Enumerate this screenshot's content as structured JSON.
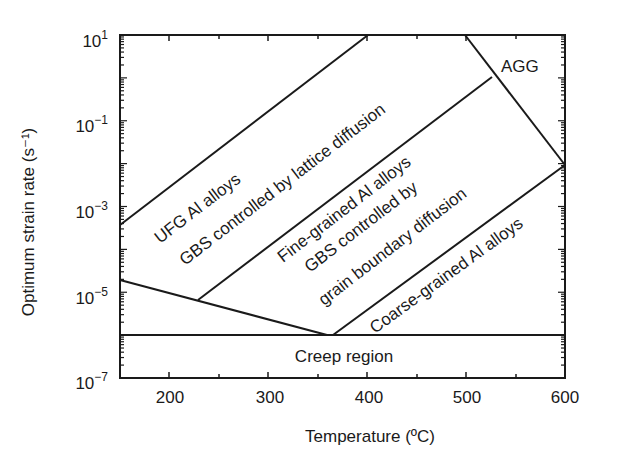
{
  "chart_data": {
    "type": "diagram",
    "title": "",
    "xlabel": "Temperature (ºC)",
    "ylabel": "Optimum strain rate (s⁻¹)",
    "xlim": [
      150,
      600
    ],
    "ylim_log10": [
      -7,
      1
    ],
    "x_ticks": [
      "200",
      "300",
      "400",
      "500",
      "600"
    ],
    "y_ticks": [
      {
        "base": "10",
        "exp": "1"
      },
      {
        "base": "10",
        "exp": "−1"
      },
      {
        "base": "10",
        "exp": "−3"
      },
      {
        "base": "10",
        "exp": "−5"
      },
      {
        "base": "10",
        "exp": "−7"
      }
    ],
    "boundaries": [
      {
        "name": "ufg-upper",
        "points": [
          [
            150,
            -3.55
          ],
          [
            400,
            1
          ]
        ]
      },
      {
        "name": "fine-grained-upper",
        "points": [
          [
            229,
            -5.3
          ],
          [
            525,
            -0.1
          ]
        ]
      },
      {
        "name": "agg-boundary",
        "points": [
          [
            497,
            1
          ],
          [
            600,
            -2
          ]
        ]
      },
      {
        "name": "coarse-grained-upper",
        "points": [
          [
            365,
            -6.0
          ],
          [
            600,
            -2
          ]
        ]
      },
      {
        "name": "lower-boundary",
        "points": [
          [
            150,
            -4.8
          ],
          [
            358,
            -6.0
          ]
        ]
      },
      {
        "name": "creep-line",
        "points": [
          [
            150,
            -6.0
          ],
          [
            600,
            -6.0
          ]
        ]
      }
    ],
    "regions": [
      {
        "label": "UFG Al alloys",
        "sublabel": "GBS controlled by lattice diffusion"
      },
      {
        "label": "Fine-grained Al alloys",
        "sublabel": "GBS controlled by grain boundary diffusion"
      },
      {
        "label": "Coarse-grained Al alloys"
      },
      {
        "label": "AGG"
      },
      {
        "label": "Creep region"
      }
    ]
  },
  "labels": {
    "ufg_line1": "UFG Al alloys",
    "ufg_line2": "GBS controlled by lattice diffusion",
    "fine_line1": "Fine-grained Al alloys",
    "fine_line2": "GBS controlled by",
    "fine_line3": "grain boundary diffusion",
    "coarse": "Coarse-grained Al alloys",
    "agg": "AGG",
    "creep": "Creep region"
  }
}
